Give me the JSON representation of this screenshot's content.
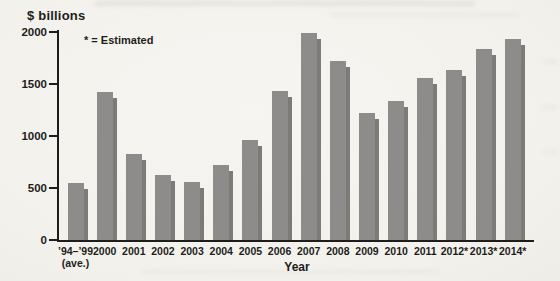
{
  "figure": {
    "y_axis_title": "$ billions",
    "note": "* = Estimated",
    "x_axis_title": "Year"
  },
  "chart_data": {
    "type": "bar",
    "title": "",
    "xlabel": "Year",
    "ylabel": "$ billions",
    "note": "* = Estimated",
    "ylim": [
      0,
      2000
    ],
    "y_ticks": [
      2000,
      1500,
      1000,
      500,
      0
    ],
    "grid": false,
    "legend_position": "none",
    "bar_color": "#8d8c8a",
    "bar_shadow_color": "#7c7b78",
    "axis_color": "#1e1d1b",
    "categories": [
      "’94–’99",
      "2000",
      "2001",
      "2002",
      "2003",
      "2004",
      "2005",
      "2006",
      "2007",
      "2008",
      "2009",
      "2010",
      "2011",
      "2012*",
      "2013*",
      "2014*"
    ],
    "category_sublabels": [
      "(ave.)",
      "",
      "",
      "",
      "",
      "",
      "",
      "",
      "",
      "",
      "",
      "",
      "",
      "",
      "",
      ""
    ],
    "values": [
      550,
      1420,
      830,
      625,
      560,
      720,
      960,
      1430,
      1990,
      1720,
      1220,
      1340,
      1555,
      1630,
      1840,
      1935
    ],
    "estimated_years": [
      "2012*",
      "2013*",
      "2014*"
    ]
  }
}
